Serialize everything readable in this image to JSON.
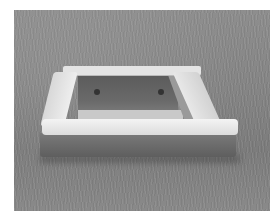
{
  "image": {
    "description": "Grayscale photograph of a square concrete frame (sandbox/planter border) sitting on a grass lawn",
    "colors": {
      "border": "#ffffff",
      "grass": "#858585",
      "concrete_top": "#e8e8e8",
      "concrete_face": "#6a6a6a",
      "inner_shadow": "#5a5a5a"
    }
  }
}
